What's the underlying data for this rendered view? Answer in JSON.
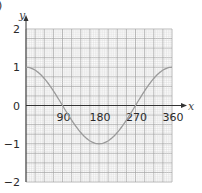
{
  "part_label": ")",
  "chart_data": {
    "type": "line",
    "title": "",
    "xlabel": "x",
    "ylabel": "y",
    "xlim": [
      0,
      360
    ],
    "ylim": [
      -2,
      2
    ],
    "x_ticks": [
      90,
      180,
      270,
      360
    ],
    "y_ticks": [
      2,
      1,
      0,
      -1,
      -2
    ],
    "x_tick_labels": [
      "90",
      "180",
      "270",
      "360"
    ],
    "y_tick_labels": [
      "2",
      "1",
      "0",
      "−1",
      "−2"
    ],
    "grid": true,
    "legend": null,
    "series": [
      {
        "name": "y = cos x",
        "x": [
          0,
          45,
          90,
          135,
          180,
          225,
          270,
          315,
          360
        ],
        "values": [
          1,
          0.71,
          0,
          -0.71,
          -1,
          -0.71,
          0,
          0.71,
          1
        ]
      }
    ]
  },
  "colors": {
    "grid_minor": "#d6d6d6",
    "grid_major": "#a8a8a8",
    "axis": "#333333",
    "curve": "#9a9a9a"
  }
}
